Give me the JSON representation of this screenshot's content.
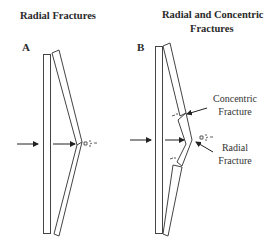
{
  "panels": {
    "a": {
      "title": "Radial Fractures",
      "label": "A"
    },
    "b": {
      "title_line1": "Radial and Concentric",
      "title_line2": "Fractures",
      "label": "B",
      "annotations": {
        "concentric_line1": "Concentric",
        "concentric_line2": "Fracture",
        "radial_line1": "Radial",
        "radial_line2": "Fracture"
      }
    }
  },
  "colors": {
    "stroke": "#3a3a3a",
    "text": "#2a2a2a",
    "background": "#ffffff"
  },
  "icons": {
    "force_arrow": "arrow-right-icon",
    "debris": "glass-fragments-icon"
  }
}
